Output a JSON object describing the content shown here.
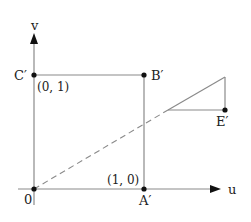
{
  "diagram": {
    "axes": {
      "x_label": "u",
      "y_label": "v",
      "origin_label": "0"
    },
    "points": {
      "A": {
        "label": "A′",
        "coord_label": "(1, 0)"
      },
      "B": {
        "label": "B′"
      },
      "C": {
        "label": "C′",
        "coord_label": "(0, 1)"
      },
      "E": {
        "label": "E′"
      }
    },
    "colors": {
      "line": "#8a8a8a",
      "point": "#111111",
      "text": "#222222"
    }
  }
}
